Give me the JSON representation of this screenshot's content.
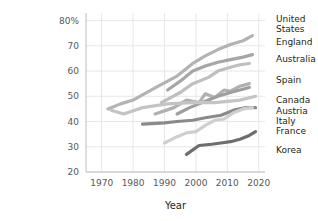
{
  "chart_data": {
    "type": "line",
    "title": "",
    "xlabel": "Year",
    "ylabel": "",
    "xlim": [
      1965,
      2022
    ],
    "ylim": [
      20,
      83
    ],
    "grid": true,
    "legend_position": "right",
    "xticks": [
      1970,
      1980,
      1990,
      2000,
      2010,
      2020
    ],
    "xtick_labels": [
      "1970",
      "1980",
      "1990",
      "2000",
      "2010",
      "2020"
    ],
    "yticks": [
      20,
      30,
      40,
      50,
      60,
      70,
      80
    ],
    "ytick_labels": [
      "20",
      "30",
      "40",
      "50",
      "60",
      "70",
      "80%"
    ],
    "series": [
      {
        "name": "United States",
        "color": "#b3b3b3",
        "x": [
          1972,
          1976,
          1980,
          1988,
          1994,
          1999,
          2003,
          2007,
          2011,
          2015,
          2018
        ],
        "values": [
          45.0,
          47.0,
          48.5,
          54.0,
          58.0,
          63.0,
          66.0,
          68.5,
          70.5,
          72.0,
          74.0
        ]
      },
      {
        "name": "England",
        "color": "#a6a6a6",
        "x": [
          1991,
          1995,
          1999,
          2003,
          2007,
          2011,
          2015,
          2018
        ],
        "values": [
          52.5,
          56.0,
          60.0,
          62.0,
          63.5,
          64.5,
          65.5,
          66.5
        ]
      },
      {
        "name": "Australia",
        "color": "#bfbfbf",
        "x": [
          1989,
          1995,
          1999,
          2004,
          2007,
          2011,
          2014,
          2017
        ],
        "values": [
          47.5,
          51.5,
          55.0,
          57.5,
          60.0,
          61.5,
          62.5,
          63.0
        ]
      },
      {
        "name": "Spain",
        "color": "#b0b0b0",
        "x": [
          1987,
          1993,
          1997,
          2001,
          2003,
          2006,
          2009,
          2011,
          2014,
          2017
        ],
        "values": [
          43.0,
          45.5,
          48.5,
          47.5,
          51.0,
          49.5,
          52.5,
          52.0,
          54.0,
          55.0
        ]
      },
      {
        "name": "Canada",
        "color": "#9e9e9e",
        "x": [
          1994,
          1998,
          2003,
          2007,
          2011,
          2014,
          2017
        ],
        "values": [
          43.0,
          45.5,
          48.0,
          50.0,
          51.5,
          52.5,
          53.5
        ]
      },
      {
        "name": "Austria",
        "color": "#c4c4c4",
        "x": [
          1973,
          1977,
          1983,
          1991,
          1999,
          2006,
          2014,
          2019
        ],
        "values": [
          44.5,
          43.0,
          45.5,
          47.0,
          47.5,
          47.5,
          48.5,
          50.0
        ]
      },
      {
        "name": "Italy",
        "color": "#8a8a8a",
        "x": [
          1983,
          1990,
          1994,
          1999,
          2003,
          2008,
          2012,
          2016,
          2019
        ],
        "values": [
          39.0,
          39.5,
          40.0,
          40.5,
          41.5,
          42.5,
          44.5,
          45.5,
          45.5
        ]
      },
      {
        "name": "France",
        "color": "#cfcfcf",
        "x": [
          1990,
          1994,
          1997,
          2000,
          2003,
          2006,
          2009,
          2012,
          2015,
          2018
        ],
        "values": [
          31.5,
          34.0,
          35.5,
          36.0,
          38.5,
          40.5,
          41.0,
          43.5,
          45.0,
          45.5
        ]
      },
      {
        "name": "Korea",
        "color": "#6d6e71",
        "x": [
          1997,
          2001,
          2005,
          2008,
          2011,
          2014,
          2017,
          2019
        ],
        "values": [
          27.0,
          30.5,
          31.0,
          31.5,
          32.0,
          33.0,
          34.5,
          36.0
        ]
      }
    ],
    "legend_entries": [
      {
        "lines": [
          "United",
          "States"
        ],
        "anchor_y": 22
      },
      {
        "lines": [
          "England"
        ],
        "anchor_y": 45
      },
      {
        "lines": [
          "Australia"
        ],
        "anchor_y": 62
      },
      {
        "lines": [
          "Spain"
        ],
        "anchor_y": 83
      },
      {
        "lines": [
          "Canada"
        ],
        "anchor_y": 103
      },
      {
        "lines": [
          "Austria"
        ],
        "anchor_y": 114
      },
      {
        "lines": [
          "Italy"
        ],
        "anchor_y": 124
      },
      {
        "lines": [
          "France"
        ],
        "anchor_y": 134
      },
      {
        "lines": [
          "Korea"
        ],
        "anchor_y": 153
      }
    ]
  }
}
